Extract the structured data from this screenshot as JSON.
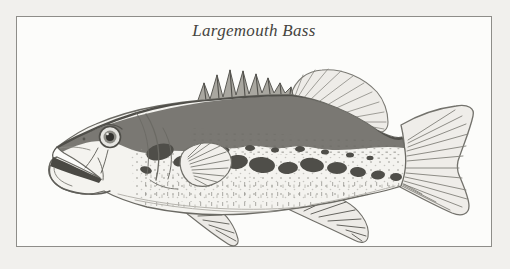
{
  "figure": {
    "caption": "Largemouth Bass"
  },
  "colors": {
    "page_background": "#f1f0ed",
    "panel_background": "#fcfcfa",
    "frame_border": "#8e8d89",
    "caption_text": "#454440"
  },
  "illustration": {
    "subject": "largemouth bass, left-facing engraved line drawing",
    "ink_dark": "#4f4e49",
    "ink_mid": "#85847e",
    "ink_light": "#b5b3ad",
    "body_fill": "#f4f3ef",
    "back_band_fill": "#6f6e68"
  }
}
